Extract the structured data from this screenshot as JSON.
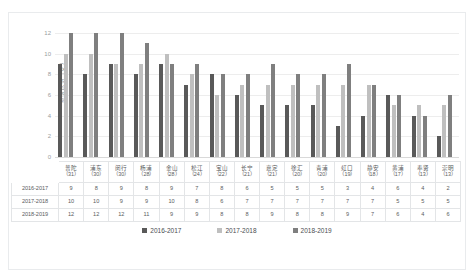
{
  "top_strip": {
    "left_text": "",
    "right_text": ""
  },
  "chart_data": {
    "type": "bar",
    "title": "",
    "xlabel": "",
    "ylabel": "参赛队伍（支）",
    "ylim": [
      0,
      12
    ],
    "yticks": [
      0,
      2,
      4,
      6,
      8,
      10,
      12
    ],
    "grid": true,
    "legend_position": "bottom",
    "categories": [
      "普陀",
      "浦东",
      "闵行",
      "杨浦",
      "金山",
      "松江",
      "宝山",
      "长宁",
      "嘉定",
      "徐汇",
      "青浦",
      "虹口",
      "静安",
      "黄浦",
      "奉贤",
      "崇明"
    ],
    "category_counts": [
      31,
      30,
      30,
      28,
      28,
      24,
      22,
      21,
      21,
      20,
      20,
      19,
      18,
      17,
      13,
      13
    ],
    "series": [
      {
        "name": "2016-2017",
        "color": "#595959",
        "values": [
          9,
          8,
          9,
          8,
          9,
          7,
          8,
          6,
          5,
          5,
          5,
          3,
          4,
          6,
          4,
          2
        ]
      },
      {
        "name": "2017-2018",
        "color": "#bfbfbf",
        "values": [
          10,
          10,
          9,
          9,
          10,
          8,
          6,
          7,
          7,
          7,
          7,
          7,
          7,
          5,
          5,
          5
        ]
      },
      {
        "name": "2018-2019",
        "color": "#7f7f7f",
        "values": [
          12,
          12,
          12,
          11,
          9,
          9,
          8,
          8,
          9,
          8,
          8,
          9,
          7,
          6,
          4,
          6
        ]
      }
    ]
  },
  "table": {
    "row_labels": [
      "2016-2017",
      "2017-2018",
      "2018-2019"
    ],
    "corner_label": ""
  },
  "legend": {
    "items": [
      {
        "label": "2016-2017",
        "color": "#595959"
      },
      {
        "label": "2017-2018",
        "color": "#bfbfbf"
      },
      {
        "label": "2018-2019",
        "color": "#7f7f7f"
      }
    ]
  }
}
